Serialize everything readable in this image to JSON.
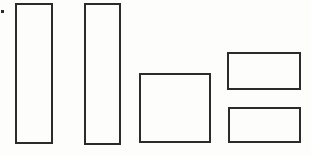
{
  "figure": {
    "background_color": "#fdfdfc",
    "stroke_color": "#2b2b2b",
    "stroke_width_px": 2,
    "canvas": {
      "width": 311,
      "height": 156
    },
    "shapes": [
      {
        "name": "tall-rectangle-1",
        "kind": "rect",
        "x": 15,
        "y": 3,
        "width": 38,
        "height": 141
      },
      {
        "name": "tall-rectangle-2",
        "kind": "rect",
        "x": 84,
        "y": 3,
        "width": 37,
        "height": 142
      },
      {
        "name": "square-rectangle",
        "kind": "rect",
        "x": 139,
        "y": 73,
        "width": 72,
        "height": 70
      },
      {
        "name": "wide-rectangle-top",
        "kind": "rect",
        "x": 227,
        "y": 52,
        "width": 74,
        "height": 38
      },
      {
        "name": "wide-rectangle-bottom",
        "kind": "rect",
        "x": 228,
        "y": 107,
        "width": 73,
        "height": 36
      },
      {
        "name": "stray-ink-dot",
        "kind": "dot",
        "x": 1,
        "y": 10,
        "width": 3,
        "height": 3
      }
    ]
  }
}
